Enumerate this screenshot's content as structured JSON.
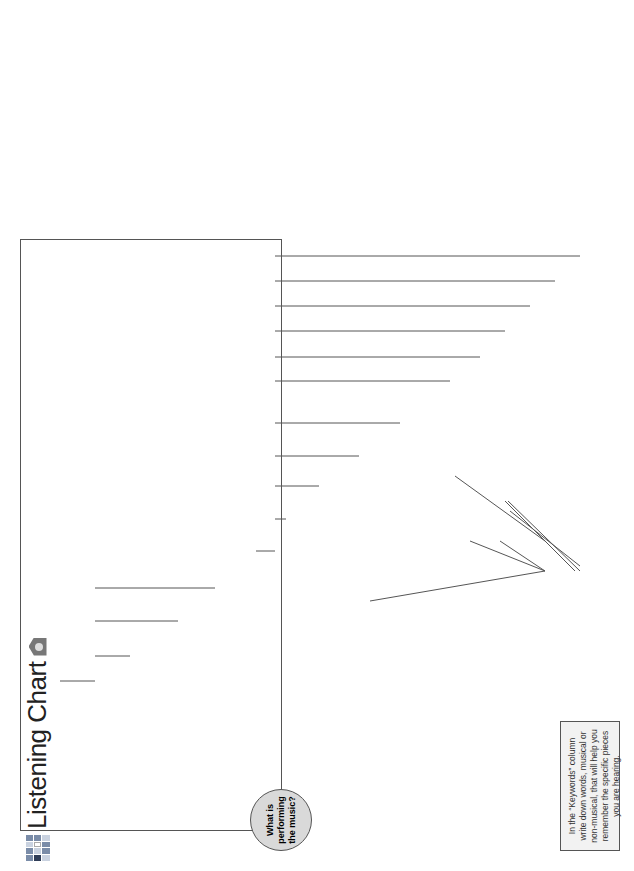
{
  "title": "Listening Chart",
  "table_main": {
    "headers": [
      "Historical Period",
      "Genre or type of piece",
      "Composer",
      "Keywords"
    ],
    "rows": [
      {
        "period": "Medieval",
        "genre": "Estampie",
        "composer": "Anonymous"
      },
      {
        "period": "Baroque",
        "genre": "Menuet or Hornpipe from a Suite",
        "composer": "G.F. Handel"
      },
      {
        "period": "Baroque",
        "genre": "Air from a Suite",
        "composer": "J.S. Bach"
      },
      {
        "period": "Baroque",
        "genre": "Solo Suite",
        "composer": "J.S. Bach"
      },
      {
        "period": "Romantic",
        "genre": "Waltz",
        "composer": "Johann Strauss II"
      },
      {
        "period": "Romantic",
        "genre": "Symphony",
        "composer": "F. Mendelssohn"
      },
      {
        "period": "Romantic",
        "genre": "Ballet Music",
        "composer": "Peter Tchaikovsky"
      },
      {
        "period": "20th Century",
        "genre": "Ballet Music",
        "composer": "Igor Stravinsky"
      },
      {
        "period": "20th Century",
        "genre": "Ballet Music",
        "composer": "Aaron Copland"
      }
    ]
  },
  "table_world": {
    "headers": [
      "Country of origin",
      "Type of dance"
    ],
    "rows": [
      {
        "country": "Bali",
        "dance": "Gamelan Angklung"
      },
      {
        "country": "Tibet",
        "dance": "Cham—Skeleton Dance"
      },
      {
        "country": "Italy",
        "dance": "Saltarello"
      },
      {
        "country": "Western Africa",
        "dance": "Rites of passage"
      },
      {
        "country": "Ireland, Scotland, Wales",
        "dance": "Celtic Reel"
      },
      {
        "country": "United States",
        "dance": "Square Dance"
      }
    ]
  },
  "diagram": {
    "root": "What is performing the music?",
    "ancient": "Ancient Instruments",
    "orchestral": "Orchestral Instruments",
    "non_western": "Non-Western Instruments",
    "fast_triple": "Fast Triple Meter",
    "perc_winds": "Percussion and Winds",
    "strings_winds": "Strings, Winds, Percussion limited to tympani",
    "triple_meter": "Triple meter",
    "strings": "Strings",
    "violin": "Violin melody Continuo bass line",
    "solo_cello": "Solo cello",
    "full_orchestra": "Full Orchestra",
    "orch_desc": [
      "Slow introduction, triple meter, many sections each with different tunes",
      "Fast, triple meter",
      "Lyrical, minor melody in oboe, brass and strings",
      "Irregular rhythms, dissonant, lots of percussion",
      "Calm, peaceful atmosphere or vigorous “cowboy” music"
    ],
    "world_desc": [
      "Gamelan",
      "Low horn, percussion, multiphonic",
      "Fast, triple meter, nasal sounding",
      "Polyrhythmic drumming, shouting, chanting",
      "Pipes, harp",
      "Fiddle, caller"
    ]
  },
  "note": "In the “Keywords” column write down words, musical or non-musical, that will help you remember the specific pieces you are hearing."
}
